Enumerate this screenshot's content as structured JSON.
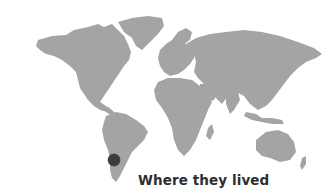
{
  "map": {
    "style": "grayscale world map",
    "land_color": "#a4a4a4",
    "background_color": "#ffffff",
    "marker": {
      "location_label": "Southern South America (Patagonia)",
      "color": "#3d3d3d"
    }
  },
  "caption": {
    "text": "Where they lived",
    "color": "#2e2e2e"
  }
}
